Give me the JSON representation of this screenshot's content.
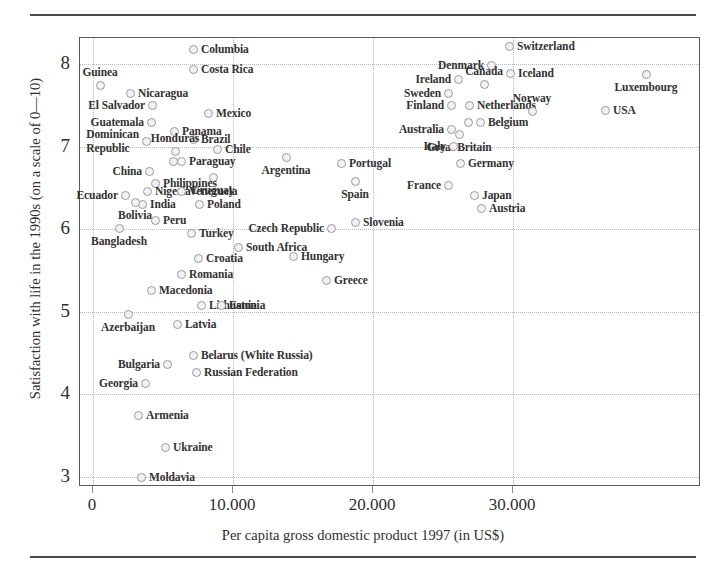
{
  "figure": {
    "x_axis_title": "Per capita gross domestic product 1997 (in US$)",
    "y_axis_title": "Satisfaction with life in the 1990s (on a scale of 0—10)"
  },
  "chart_data": {
    "type": "scatter",
    "title": "",
    "xlabel": "Per capita gross domestic product 1997 (in US$)",
    "ylabel": "Satisfaction with life in the 1990s (on a scale of 0—10)",
    "xlim": [
      -1500,
      42000
    ],
    "ylim": [
      2.8,
      8.35
    ],
    "xticks": [
      0,
      10000,
      20000,
      30000
    ],
    "xtick_labels": [
      "0",
      "10.000",
      "20.000",
      "30.000"
    ],
    "yticks": [
      3,
      4,
      5,
      6,
      7,
      8
    ],
    "ytick_labels": [
      "3",
      "4",
      "5",
      "6",
      "7",
      "8"
    ],
    "grid": true,
    "legend": "none",
    "marker": "open-circle",
    "points": [
      {
        "name": "Columbia",
        "x": 7000,
        "y": 8.2,
        "lx": 192,
        "ly": 48,
        "pos": "right"
      },
      {
        "name": "Costa Rica",
        "x": 7000,
        "y": 7.96,
        "lx": 192,
        "ly": 68,
        "pos": "right"
      },
      {
        "name": "Switzerland",
        "x": 26000,
        "y": 8.1,
        "lx": 508,
        "ly": 45,
        "pos": "right"
      },
      {
        "name": "Denmark",
        "x": 24300,
        "y": 7.93,
        "lx": 490,
        "ly": 64,
        "pos": "left"
      },
      {
        "name": "Canada",
        "x": 22000,
        "y": 7.76,
        "lx": 483,
        "ly": 83,
        "pos": "above"
      },
      {
        "name": "Iceland",
        "x": 24300,
        "y": 7.78,
        "lx": 509,
        "ly": 72,
        "pos": "right"
      },
      {
        "name": "Ireland",
        "x": 20900,
        "y": 7.66,
        "lx": 457,
        "ly": 78,
        "pos": "left"
      },
      {
        "name": "Guinea",
        "x": 1400,
        "y": 7.82,
        "lx": 99,
        "ly": 84,
        "pos": "above"
      },
      {
        "name": "Nicaragua",
        "x": 3600,
        "y": 7.72,
        "lx": 129,
        "ly": 92,
        "pos": "right"
      },
      {
        "name": "Sweden",
        "x": 20100,
        "y": 7.59,
        "lx": 447,
        "ly": 92,
        "pos": "left"
      },
      {
        "name": "Finland",
        "x": 20400,
        "y": 7.48,
        "lx": 450,
        "ly": 104,
        "pos": "left"
      },
      {
        "name": "Netherlands",
        "x": 21700,
        "y": 7.48,
        "lx": 468,
        "ly": 104,
        "pos": "right"
      },
      {
        "name": "Norway",
        "x": 25400,
        "y": 7.43,
        "lx": 531,
        "ly": 110,
        "pos": "above"
      },
      {
        "name": "USA",
        "x": 28500,
        "y": 7.42,
        "lx": 604,
        "ly": 109,
        "pos": "right"
      },
      {
        "name": "Luxembourg",
        "x": 33500,
        "y": 7.83,
        "lx": 645,
        "ly": 73,
        "pos": "below"
      },
      {
        "name": "El Salvador",
        "x": 3900,
        "y": 7.56,
        "lx": 151,
        "ly": 104,
        "pos": "left"
      },
      {
        "name": "Mexico",
        "x": 8000,
        "y": 7.5,
        "lx": 207,
        "ly": 112,
        "pos": "right"
      },
      {
        "name": "Guatemala",
        "x": 4200,
        "y": 7.41,
        "lx": 150,
        "ly": 121,
        "pos": "left"
      },
      {
        "name": "Panama",
        "x": 5300,
        "y": 7.33,
        "lx": 173,
        "ly": 130,
        "pos": "right"
      },
      {
        "name": "Belgium",
        "x": 22200,
        "y": 7.35,
        "lx": 479,
        "ly": 121,
        "pos": "right"
      },
      {
        "name": "Belgium2",
        "x": 21700,
        "y": 7.35,
        "lx": 467,
        "ly": 121,
        "pos": "none"
      },
      {
        "name": "Australia",
        "x": 20300,
        "y": 7.26,
        "lx": 450,
        "ly": 128,
        "pos": "left"
      },
      {
        "name": "Great Britain",
        "x": 20900,
        "y": 7.24,
        "lx": 458,
        "ly": 133,
        "pos": "below"
      },
      {
        "name": "Brazil",
        "x": 6900,
        "y": 7.2,
        "lx": 192,
        "ly": 138,
        "pos": "right"
      },
      {
        "name": "Dominican Republic",
        "x": 4600,
        "y": 7.1,
        "lx": 145,
        "ly": 140,
        "pos": "left"
      },
      {
        "name": "Honduras",
        "x": 5400,
        "y": 7.02,
        "lx": 174,
        "ly": 150,
        "pos": "above"
      },
      {
        "name": "Italy",
        "x": 20400,
        "y": 7.08,
        "lx": 452,
        "ly": 145,
        "pos": "left"
      },
      {
        "name": "Chile",
        "x": 8400,
        "y": 7.04,
        "lx": 216,
        "ly": 148,
        "pos": "right"
      },
      {
        "name": "Paraguay",
        "x": 5700,
        "y": 6.93,
        "lx": 180,
        "ly": 160,
        "pos": "right"
      },
      {
        "name": "Paraguay2",
        "x": 5300,
        "y": 6.93,
        "lx": 172,
        "ly": 160,
        "pos": "none"
      },
      {
        "name": "Argentina",
        "x": 10400,
        "y": 6.97,
        "lx": 285,
        "ly": 156,
        "pos": "below"
      },
      {
        "name": "Portugal",
        "x": 13300,
        "y": 6.92,
        "lx": 340,
        "ly": 162,
        "pos": "right"
      },
      {
        "name": "Germany",
        "x": 21600,
        "y": 6.9,
        "lx": 459,
        "ly": 162,
        "pos": "right"
      },
      {
        "name": "China",
        "x": 3800,
        "y": 6.86,
        "lx": 148,
        "ly": 170,
        "pos": "left"
      },
      {
        "name": "Uruguay",
        "x": 8200,
        "y": 6.78,
        "lx": 212,
        "ly": 176,
        "pos": "below"
      },
      {
        "name": "Philippines",
        "x": 4300,
        "y": 6.7,
        "lx": 154,
        "ly": 182,
        "pos": "right"
      },
      {
        "name": "Spain",
        "x": 15700,
        "y": 6.72,
        "lx": 354,
        "ly": 180,
        "pos": "below"
      },
      {
        "name": "France",
        "x": 20200,
        "y": 6.73,
        "lx": 447,
        "ly": 184,
        "pos": "left"
      },
      {
        "name": "Ecuador",
        "x": 2600,
        "y": 6.55,
        "lx": 124,
        "ly": 194,
        "pos": "left"
      },
      {
        "name": "Nigeria",
        "x": 3700,
        "y": 6.58,
        "lx": 146,
        "ly": 190,
        "pos": "right"
      },
      {
        "name": "Venezuela",
        "x": 5600,
        "y": 6.63,
        "lx": 180,
        "ly": 190,
        "pos": "right"
      },
      {
        "name": "Japan",
        "x": 22100,
        "y": 6.6,
        "lx": 473,
        "ly": 194,
        "pos": "right"
      },
      {
        "name": "India",
        "x": 3300,
        "y": 6.45,
        "lx": 141,
        "ly": 203,
        "pos": "right"
      },
      {
        "name": "Bolivia",
        "x": 2900,
        "y": 6.45,
        "lx": 134,
        "ly": 201,
        "pos": "below"
      },
      {
        "name": "Poland",
        "x": 7300,
        "y": 6.45,
        "lx": 198,
        "ly": 203,
        "pos": "right"
      },
      {
        "name": "Austria",
        "x": 22600,
        "y": 6.48,
        "lx": 480,
        "ly": 207,
        "pos": "right"
      },
      {
        "name": "Peru",
        "x": 4200,
        "y": 6.22,
        "lx": 154,
        "ly": 219,
        "pos": "right"
      },
      {
        "name": "Bangladesh",
        "x": 2200,
        "y": 6.12,
        "lx": 118,
        "ly": 227,
        "pos": "below"
      },
      {
        "name": "Czech Republic",
        "x": 12800,
        "y": 6.08,
        "lx": 330,
        "ly": 227,
        "pos": "left"
      },
      {
        "name": "Slovenia",
        "x": 14100,
        "y": 6.12,
        "lx": 354,
        "ly": 221,
        "pos": "right"
      },
      {
        "name": "Turkey",
        "x": 6000,
        "y": 6.02,
        "lx": 190,
        "ly": 232,
        "pos": "right"
      },
      {
        "name": "South Africa",
        "x": 7300,
        "y": 5.88,
        "lx": 237,
        "ly": 246,
        "pos": "right"
      },
      {
        "name": "Hungary",
        "x": 10800,
        "y": 5.8,
        "lx": 292,
        "ly": 255,
        "pos": "right"
      },
      {
        "name": "Croatia",
        "x": 6700,
        "y": 5.77,
        "lx": 197,
        "ly": 257,
        "pos": "right"
      },
      {
        "name": "Romania",
        "x": 5600,
        "y": 5.62,
        "lx": 180,
        "ly": 273,
        "pos": "right"
      },
      {
        "name": "Greece",
        "x": 13300,
        "y": 5.33,
        "lx": 325,
        "ly": 279,
        "pos": "right"
      },
      {
        "name": "Macedonia",
        "x": 4000,
        "y": 5.48,
        "lx": 150,
        "ly": 289,
        "pos": "right"
      },
      {
        "name": "Lithuania",
        "x": 6000,
        "y": 5.02,
        "lx": 200,
        "ly": 304,
        "pos": "right"
      },
      {
        "name": "Estonia",
        "x": 7300,
        "y": 5.02,
        "lx": 220,
        "ly": 304,
        "pos": "right"
      },
      {
        "name": "Azerbaijan",
        "x": 1800,
        "y": 4.93,
        "lx": 127,
        "ly": 313,
        "pos": "below"
      },
      {
        "name": "Latvia",
        "x": 5400,
        "y": 4.85,
        "lx": 176,
        "ly": 323,
        "pos": "right"
      },
      {
        "name": "Belarus (White Russia)",
        "x": 6200,
        "y": 4.42,
        "lx": 192,
        "ly": 354,
        "pos": "right"
      },
      {
        "name": "Bulgaria",
        "x": 4600,
        "y": 4.35,
        "lx": 166,
        "ly": 363,
        "pos": "left"
      },
      {
        "name": "Russian Federation",
        "x": 6400,
        "y": 4.28,
        "lx": 195,
        "ly": 371,
        "pos": "right"
      },
      {
        "name": "Georgia",
        "x": 3500,
        "y": 4.16,
        "lx": 144,
        "ly": 382,
        "pos": "left"
      },
      {
        "name": "Armenia",
        "x": 3200,
        "y": 3.77,
        "lx": 137,
        "ly": 414,
        "pos": "right"
      },
      {
        "name": "Ukraine",
        "x": 4500,
        "y": 3.45,
        "lx": 164,
        "ly": 446,
        "pos": "right"
      },
      {
        "name": "Moldavia",
        "x": 3400,
        "y": 3.02,
        "lx": 140,
        "ly": 476,
        "pos": "right"
      }
    ],
    "multi_line_labels": {
      "Dominican Republic": [
        "Dominican",
        "Republic"
      ]
    }
  }
}
